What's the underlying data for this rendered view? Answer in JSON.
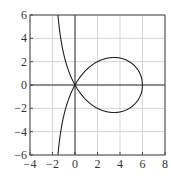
{
  "chart_data": {
    "type": "line",
    "title": "",
    "xlabel": "",
    "ylabel": "",
    "xlim": [
      -4,
      8
    ],
    "ylim": [
      -6,
      6
    ],
    "grid": true,
    "legend": null,
    "x_ticks": [
      -4,
      -2,
      0,
      2,
      4,
      6,
      8
    ],
    "y_ticks": [
      -6,
      -4,
      -2,
      0,
      2,
      4,
      6
    ],
    "x_tick_labels": [
      "−4",
      "−2",
      "0",
      "2",
      "4",
      "6",
      "8"
    ],
    "y_tick_labels": [
      "−6",
      "−4",
      "−2",
      "0",
      "2",
      "4",
      "6"
    ],
    "annotations": [
      "curve resembling y² = x²(6−x)/(x+2): loop from (0,0) to (6,0), branch asymptotic to x = −2"
    ],
    "series": [
      {
        "name": "curve-branch-a",
        "x": [
          -1.54,
          -1.5,
          -1.4,
          -1.2,
          -1.0,
          -0.5,
          0.0,
          0.5,
          1.0,
          2.0,
          3.0,
          3.5,
          4.0,
          5.0,
          5.5,
          5.9,
          6.0
        ],
        "y": [
          -6.23,
          -5.81,
          -4.92,
          -3.6,
          -2.646,
          -1.041,
          0.0,
          0.742,
          1.291,
          2.0,
          2.324,
          2.36,
          2.309,
          1.89,
          1.42,
          0.664,
          0.0
        ]
      },
      {
        "name": "curve-branch-b",
        "x": [
          -1.54,
          -1.5,
          -1.4,
          -1.2,
          -1.0,
          -0.5,
          0.0,
          0.5,
          1.0,
          2.0,
          3.0,
          3.5,
          4.0,
          5.0,
          5.5,
          5.9,
          6.0
        ],
        "y": [
          6.23,
          5.81,
          4.92,
          3.6,
          2.646,
          1.041,
          0.0,
          -0.742,
          -1.291,
          -2.0,
          -2.324,
          -2.36,
          -2.309,
          -1.89,
          -1.42,
          -0.664,
          0.0
        ]
      }
    ]
  },
  "colors": {
    "curve": "#222222",
    "axes": "#333333",
    "grid": "#cccccc",
    "frame": "#444444"
  }
}
